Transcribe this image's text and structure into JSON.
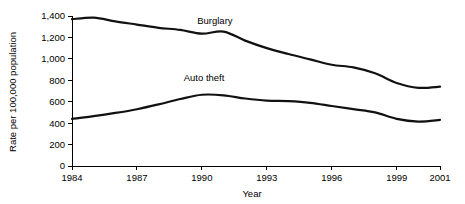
{
  "chart_data": {
    "type": "line",
    "title": "",
    "xlabel": "Year",
    "ylabel": "Rate per 100,000 population",
    "grid": false,
    "legend": "inline-labels",
    "xlim": [
      1984,
      2001
    ],
    "ylim": [
      0,
      1400
    ],
    "x": [
      1984,
      1985,
      1986,
      1987,
      1988,
      1989,
      1990,
      1991,
      1992,
      1993,
      1994,
      1995,
      1996,
      1997,
      1998,
      1999,
      2000,
      2001
    ],
    "xticks": [
      1984,
      1987,
      1990,
      1993,
      1996,
      1999,
      2001
    ],
    "xtick_labels": [
      "1984",
      "1987",
      "1990",
      "1993",
      "1996",
      "1999",
      "2001"
    ],
    "yticks": [
      0,
      200,
      400,
      600,
      800,
      1000,
      1200,
      1400
    ],
    "ytick_labels": [
      "0",
      "200",
      "400",
      "600",
      "800",
      "1,000",
      "1,200",
      "1,400"
    ],
    "series": [
      {
        "name": "Burglary",
        "label_x": 1990.6,
        "label_y": 1330,
        "values": [
          1370,
          1385,
          1350,
          1320,
          1290,
          1270,
          1235,
          1255,
          1170,
          1100,
          1045,
          995,
          945,
          920,
          865,
          775,
          730,
          740
        ]
      },
      {
        "name": "Auto theft",
        "label_x": 1990.1,
        "label_y": 790,
        "values": [
          440,
          465,
          495,
          530,
          575,
          625,
          665,
          660,
          630,
          610,
          605,
          590,
          560,
          530,
          500,
          440,
          415,
          430
        ]
      }
    ]
  }
}
